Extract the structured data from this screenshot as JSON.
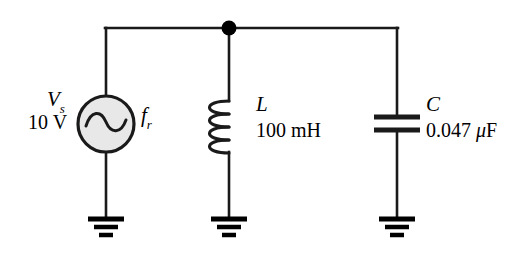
{
  "figure": {
    "background_color": "#ffffff",
    "wire_color": "#1a1a1a",
    "source_fill_color": "#e8e8e8"
  },
  "source": {
    "name": "ac-voltage-source",
    "symbol": "V",
    "symbol_subscript": "s",
    "value": "10 V",
    "frequency_symbol": "f",
    "frequency_subscript": "r",
    "waveform": "sine"
  },
  "inductor": {
    "name": "inductor",
    "symbol": "L",
    "value": "100 mH",
    "coil_loops": 4
  },
  "capacitor": {
    "name": "capacitor",
    "symbol": "C",
    "value_number": "0.047",
    "value_unit_prefix": "μ",
    "value_unit": "F",
    "value": "0.047 μF",
    "plates": 2
  },
  "nodes": {
    "junction_label": "top-node-junction",
    "ground_count": 3
  }
}
